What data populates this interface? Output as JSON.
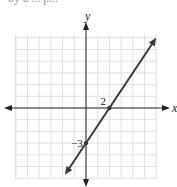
{
  "header": {
    "cut_text": "by a ... p..."
  },
  "chart_data": {
    "type": "line",
    "title": "",
    "xlabel": "x",
    "ylabel": "y",
    "xlim": [
      -6,
      6
    ],
    "ylim": [
      -6,
      6
    ],
    "grid": true,
    "grid_step": 1,
    "series": [
      {
        "name": "line",
        "slope": 1.5,
        "intercept": -3,
        "x": [
          -1.8,
          6
        ],
        "y": [
          -5.7,
          6
        ]
      }
    ],
    "annotations": [
      {
        "text": "2",
        "x": 2,
        "y": 0,
        "role": "x-intercept"
      },
      {
        "text": "−3",
        "x": 0,
        "y": -3,
        "role": "y-intercept"
      }
    ],
    "colors": {
      "line": "#3a3a3a",
      "grid": "#d9d9d9",
      "axis": "#222222"
    }
  }
}
